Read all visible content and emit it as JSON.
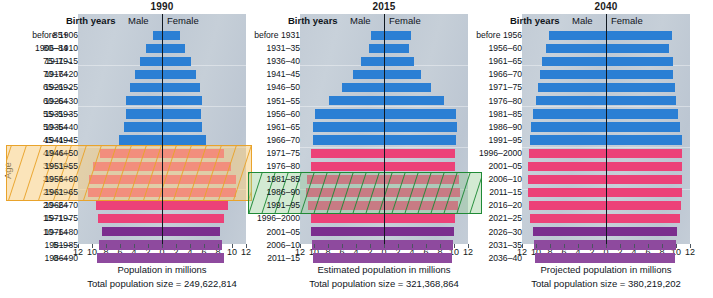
{
  "figure": {
    "age_axis_title": "Age",
    "age_groups": [
      "85+",
      "80–84",
      "75–79",
      "70–74",
      "65–69",
      "60–64",
      "55–59",
      "50–54",
      "45–49",
      "40–44",
      "35–39",
      "30–34",
      "25–29",
      "20–24",
      "15–19",
      "10–14",
      "5–9",
      "0–4"
    ],
    "column_headers": {
      "birth_years": "Birth years",
      "male": "Male",
      "female": "Female"
    },
    "x_tick_labels": [
      "12",
      "10",
      "8",
      "6",
      "4",
      "2",
      "0",
      "2",
      "4",
      "6",
      "8",
      "10",
      "12"
    ]
  },
  "colors": {
    "blue": "#2b7fd4",
    "pink": "#ec4178",
    "purple": "#7b2e8e",
    "highlight_orange": "#e9a32b",
    "highlight_green": "#1f8a36",
    "plot_background": "#c3ccd6",
    "axis": "#101820"
  },
  "chart_data": {
    "type": "bar",
    "xlabel": "Population in millions",
    "ylabel": "Age",
    "xlim": [
      -12,
      12
    ],
    "grid": false,
    "legend": [
      "Male",
      "Female"
    ],
    "categories": [
      "85+",
      "80–84",
      "75–79",
      "70–74",
      "65–69",
      "60–64",
      "55–59",
      "50–54",
      "45–49",
      "40–44",
      "35–39",
      "30–34",
      "25–29",
      "20–24",
      "15–19",
      "10–14",
      "5–9",
      "0–4"
    ],
    "panels": [
      {
        "year": "1990",
        "caption": "Population in millions",
        "total_label": "Total population size = 249,622,814",
        "total_population": 249622814,
        "birth_years": [
          "before 1906",
          "1906–1910",
          "1911–15",
          "1916–20",
          "1921–25",
          "1926–30",
          "1931–35",
          "1936–40",
          "1941–45",
          "1946–50",
          "1951–55",
          "1956–60",
          "1961–65",
          "1966–70",
          "1971–75",
          "1976–80",
          "1981–85",
          "1986–90"
        ],
        "bar_colors": [
          "blue",
          "blue",
          "blue",
          "blue",
          "blue",
          "blue",
          "blue",
          "blue",
          "blue",
          "pink",
          "pink",
          "pink",
          "pink",
          "pink",
          "pink",
          "purple",
          "purple",
          "purple"
        ],
        "male": [
          1.3,
          2.3,
          3.1,
          3.9,
          4.6,
          5.1,
          5.1,
          5.4,
          6.2,
          8.8,
          9.8,
          10.4,
          10.6,
          9.4,
          9.2,
          8.6,
          9.0,
          9.3
        ],
        "female": [
          2.5,
          3.3,
          4.1,
          4.8,
          5.4,
          5.7,
          5.5,
          5.7,
          6.3,
          8.9,
          9.9,
          10.5,
          10.6,
          9.4,
          8.9,
          8.3,
          8.6,
          8.9
        ],
        "highlight": {
          "color": "highlight_orange",
          "age_groups": [
            "40–44",
            "35–39",
            "30–34",
            "25–29"
          ],
          "birth_years": [
            "1946–50",
            "1951–55",
            "1956–60",
            "1961–65"
          ],
          "label": "baby boom cohort"
        }
      },
      {
        "year": "2015",
        "caption": "Estimated population in millions",
        "total_label": "Total population size = 321,368,864",
        "total_population": 321368864,
        "birth_years": [
          "before 1931",
          "1931–35",
          "1936–40",
          "1941–45",
          "1946–50",
          "1951–55",
          "1956–60",
          "1961–65",
          "1966–70",
          "1971–75",
          "1976–80",
          "1981–85",
          "1986–90",
          "1991–95",
          "1996–2000",
          "2001–05",
          "2006–10",
          "2011–15"
        ],
        "bar_colors": [
          "blue",
          "blue",
          "blue",
          "blue",
          "blue",
          "blue",
          "blue",
          "blue",
          "blue",
          "pink",
          "pink",
          "pink",
          "pink",
          "pink",
          "pink",
          "purple",
          "purple",
          "purple"
        ],
        "male": [
          1.9,
          2.1,
          3.3,
          4.4,
          6.0,
          7.9,
          9.9,
          10.1,
          10.2,
          10.4,
          10.4,
          11.0,
          11.1,
          10.8,
          10.5,
          10.4,
          10.3,
          10.1
        ],
        "female": [
          3.8,
          3.5,
          4.3,
          5.3,
          6.7,
          8.5,
          10.3,
          10.4,
          10.3,
          10.2,
          10.2,
          10.7,
          10.8,
          10.5,
          10.2,
          10.0,
          9.9,
          9.7
        ],
        "highlight": {
          "color": "highlight_green",
          "age_groups": [
            "30–34",
            "25–29",
            "20–24"
          ],
          "birth_years": [
            "1981–85",
            "1986–90",
            "1991–95"
          ],
          "label": "millennial cohort"
        }
      },
      {
        "year": "2040",
        "caption": "Projected population in millions",
        "total_label": "Total population size = 380,219,202",
        "total_population": 380219202,
        "birth_years": [
          "before 1956",
          "1956–60",
          "1961–65",
          "1966–70",
          "1971–75",
          "1976–80",
          "1981–85",
          "1986–90",
          "1991–95",
          "1996–2000",
          "2001–05",
          "2006–10",
          "2011–15",
          "2016–20",
          "2021–25",
          "2026–30",
          "2031–35",
          "2036–40"
        ],
        "bar_colors": [
          "blue",
          "blue",
          "blue",
          "blue",
          "blue",
          "blue",
          "blue",
          "blue",
          "blue",
          "pink",
          "pink",
          "pink",
          "pink",
          "pink",
          "pink",
          "purple",
          "purple",
          "purple"
        ],
        "male": [
          8.2,
          8.6,
          9.2,
          9.4,
          9.7,
          10.0,
          10.4,
          10.7,
          10.9,
          11.0,
          11.1,
          11.1,
          11.1,
          11.0,
          10.8,
          10.5,
          10.3,
          10.1
        ],
        "female": [
          9.4,
          9.0,
          9.6,
          9.6,
          9.8,
          10.0,
          10.3,
          10.6,
          10.8,
          10.8,
          10.9,
          10.9,
          10.9,
          10.7,
          10.6,
          10.2,
          10.0,
          9.8
        ],
        "highlight": null
      }
    ]
  }
}
